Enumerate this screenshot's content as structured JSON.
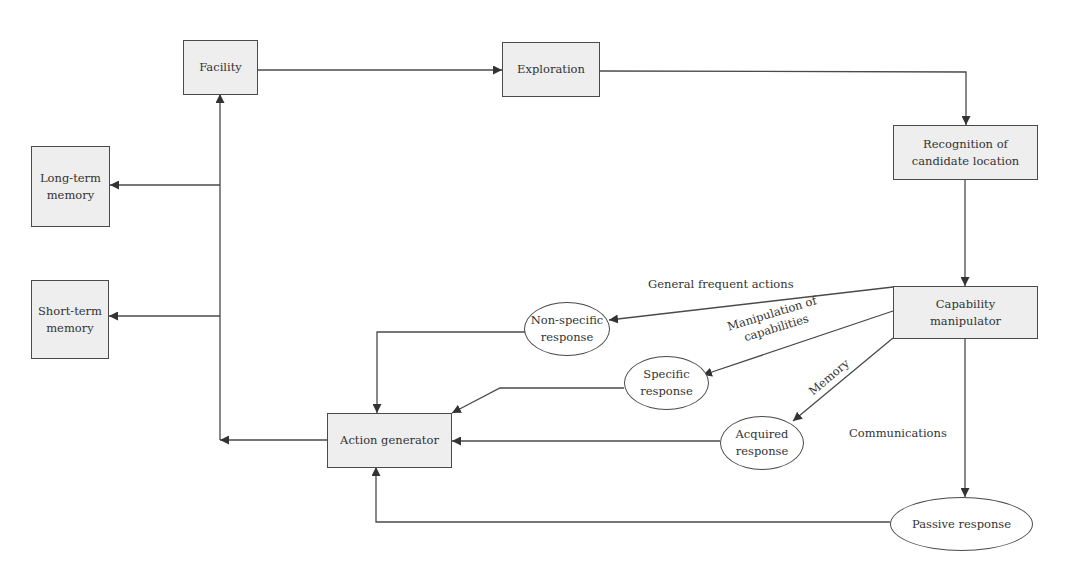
{
  "diagram": {
    "colors": {
      "box_fill": "#eeeeee",
      "stroke": "#4a4a4a",
      "text": "#333333",
      "background": "#ffffff"
    },
    "boxes": {
      "facility": {
        "line1": "Facility"
      },
      "exploration": {
        "line1": "Exploration"
      },
      "recognition": {
        "line1": "Recognition of",
        "line2": "candidate location"
      },
      "capability_manipulator": {
        "line1": "Capability",
        "line2": "manipulator"
      },
      "long_term_memory": {
        "line1": "Long-term",
        "line2": "memory"
      },
      "short_term_memory": {
        "line1": "Short-term",
        "line2": "memory"
      },
      "action_generator": {
        "line1": "Action generator"
      }
    },
    "ellipses": {
      "non_specific_response": {
        "line1": "Non-specific",
        "line2": "response"
      },
      "specific_response": {
        "line1": "Specific",
        "line2": "response"
      },
      "acquired_response": {
        "line1": "Acquired",
        "line2": "response"
      },
      "passive_response": {
        "line1": "Passive response"
      }
    },
    "edge_labels": {
      "general_frequent_actions": "General frequent actions",
      "manipulation_of_capabilities_1": "Manipulation of",
      "manipulation_of_capabilities_2": "capabilities",
      "memory": "Memory",
      "communications": "Communications"
    },
    "edges": [
      {
        "from": "Facility",
        "to": "Exploration"
      },
      {
        "from": "Exploration",
        "to": "Recognition of candidate location"
      },
      {
        "from": "Recognition of candidate location",
        "to": "Capability manipulator"
      },
      {
        "from": "Capability manipulator",
        "to": "Non-specific response",
        "label": "General frequent actions"
      },
      {
        "from": "Capability manipulator",
        "to": "Specific response",
        "label": "Manipulation of capabilities"
      },
      {
        "from": "Capability manipulator",
        "to": "Acquired response",
        "label": "Memory"
      },
      {
        "from": "Capability manipulator",
        "to": "Passive response",
        "label": "Communications"
      },
      {
        "from": "Non-specific response",
        "to": "Action generator"
      },
      {
        "from": "Specific response",
        "to": "Action generator"
      },
      {
        "from": "Acquired response",
        "to": "Action generator"
      },
      {
        "from": "Passive response",
        "to": "Action generator"
      },
      {
        "from": "Action generator",
        "to": "Facility"
      },
      {
        "from": "Action generator",
        "to": "Long-term memory"
      },
      {
        "from": "Action generator",
        "to": "Short-term memory"
      }
    ]
  }
}
